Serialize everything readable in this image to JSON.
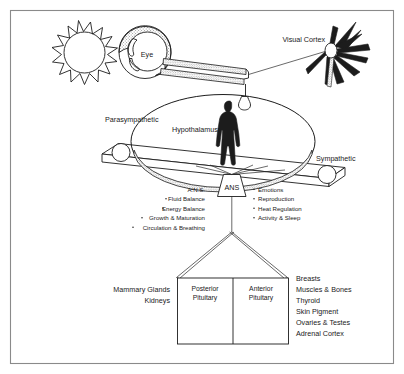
{
  "figure": {
    "frame_color": "#8a8a8a",
    "ink_color": "#1c1c1c",
    "background": "#ffffff"
  },
  "labels": {
    "eye": "Eye",
    "visual_cortex": "Visual Cortex",
    "parasympathetic": "Parasympathetic",
    "sympathetic": "Sympathetic",
    "hypothalamus": "Hypothalamus",
    "ans": "ANS"
  },
  "left_functions": [
    "A.N.S.",
    "Fluid Balance",
    "Energy Balance",
    "Growth & Maturation",
    "Circulation & Breathing"
  ],
  "right_functions": [
    "Emotions",
    "Reproduction",
    "Heat Regulation",
    "Activity & Sleep"
  ],
  "pituitary": {
    "posterior_line1": "Posterior",
    "posterior_line2": "Pituitary",
    "anterior_line1": "Anterior",
    "anterior_line2": "Pituitary"
  },
  "posterior_targets": [
    "Mammary Glands",
    "Kidneys"
  ],
  "anterior_targets": [
    "Breasts",
    "Muscles & Bones",
    "Thyroid",
    "Skin Pigment",
    "Ovaries & Testes",
    "Adrenal Cortex"
  ],
  "icons": {
    "sun": "sun-icon",
    "eye": "eye-icon",
    "optic_nerve": "optic-nerve-icon",
    "visual_cortex_neuron": "neuron-starburst-icon",
    "human_figure": "human-silhouette-icon",
    "seesaw": "balance-beam-icon"
  }
}
